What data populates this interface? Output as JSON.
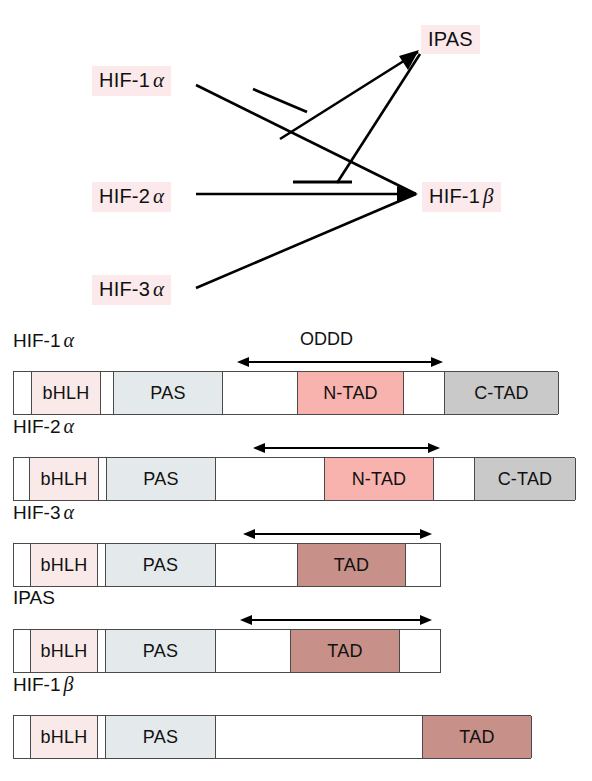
{
  "network": {
    "nodes": [
      {
        "id": "hif1a",
        "base": "HIF-1",
        "greek": "α",
        "name": "HIF-1α"
      },
      {
        "id": "hif2a",
        "base": "HIF-2",
        "greek": "α",
        "name": "HIF-2α"
      },
      {
        "id": "hif3a",
        "base": "HIF-3",
        "greek": "α",
        "name": "HIF-3α"
      },
      {
        "id": "ipas",
        "base": "IPAS",
        "greek": "",
        "name": "IPAS"
      },
      {
        "id": "hif1b",
        "base": "HIF-1",
        "greek": "β",
        "name": "HIF-1β"
      }
    ],
    "edges": [
      {
        "from": "hif2a",
        "to": "hif1b",
        "kind": "arrow"
      },
      {
        "from": "hif3a",
        "to": "hif1b",
        "kind": "arrow"
      },
      {
        "from": "hif1a",
        "to": "hif1b",
        "kind": "arrow"
      },
      {
        "from": "ipas",
        "to": "hif1a",
        "kind": "inhibition"
      },
      {
        "from": "ipas",
        "to": "hif2a",
        "kind": "inhibition"
      }
    ],
    "line_color": "#000000"
  },
  "rows": [
    {
      "id": "hif1a",
      "label_base": "HIF-1",
      "label_greek": "α",
      "annotation": "ODDD",
      "bar": {
        "left": 13,
        "width": 545
      },
      "arrow": {
        "left": 237,
        "right": 443
      },
      "annotation_left": 300,
      "segments": [
        {
          "name": "bHLH",
          "label": "bHLH",
          "left": 30,
          "width": 70,
          "style": "seg-bhlh"
        },
        {
          "name": "PAS",
          "label": "PAS",
          "left": 112,
          "width": 110,
          "style": "seg-pas"
        },
        {
          "name": "N-TAD",
          "label": "N-TAD",
          "left": 296,
          "width": 107,
          "style": "seg-ntad"
        },
        {
          "name": "C-TAD",
          "label": "C-TAD",
          "left": 443,
          "width": 115,
          "style": "seg-ctad"
        }
      ]
    },
    {
      "id": "hif2a",
      "label_base": "HIF-2",
      "label_greek": "α",
      "annotation": "",
      "bar": {
        "left": 13,
        "width": 562
      },
      "arrow": {
        "left": 253,
        "right": 440
      },
      "annotation_left": 0,
      "segments": [
        {
          "name": "bHLH",
          "label": "bHLH",
          "left": 28,
          "width": 70,
          "style": "seg-bhlh"
        },
        {
          "name": "PAS",
          "label": "PAS",
          "left": 105,
          "width": 110,
          "style": "seg-pas"
        },
        {
          "name": "N-TAD",
          "label": "N-TAD",
          "left": 323,
          "width": 110,
          "style": "seg-ntad"
        },
        {
          "name": "C-TAD",
          "label": "C-TAD",
          "left": 473,
          "width": 102,
          "style": "seg-ctad"
        }
      ]
    },
    {
      "id": "hif3a",
      "label_base": "HIF-3",
      "label_greek": "α",
      "annotation": "",
      "bar": {
        "left": 13,
        "width": 428
      },
      "arrow": {
        "left": 243,
        "right": 432
      },
      "annotation_left": 0,
      "segments": [
        {
          "name": "bHLH",
          "label": "bHLH",
          "left": 29,
          "width": 68,
          "style": "seg-bhlh"
        },
        {
          "name": "PAS",
          "label": "PAS",
          "left": 104,
          "width": 111,
          "style": "seg-pas"
        },
        {
          "name": "TAD",
          "label": "TAD",
          "left": 296,
          "width": 109,
          "style": "seg-tad"
        }
      ]
    },
    {
      "id": "ipas",
      "label_base": "IPAS",
      "label_greek": "",
      "annotation": "",
      "bar": {
        "left": 13,
        "width": 428
      },
      "arrow": {
        "left": 240,
        "right": 432
      },
      "annotation_left": 0,
      "segments": [
        {
          "name": "bHLH",
          "label": "bHLH",
          "left": 29,
          "width": 68,
          "style": "seg-bhlh"
        },
        {
          "name": "PAS",
          "label": "PAS",
          "left": 104,
          "width": 111,
          "style": "seg-pas"
        },
        {
          "name": "TAD",
          "label": "TAD",
          "left": 289,
          "width": 110,
          "style": "seg-tad"
        }
      ]
    },
    {
      "id": "hif1b",
      "label_base": "HIF-1",
      "label_greek": "β",
      "annotation": "",
      "bar": {
        "left": 13,
        "width": 518
      },
      "arrow": null,
      "annotation_left": 0,
      "segments": [
        {
          "name": "bHLH",
          "label": "bHLH",
          "left": 29,
          "width": 68,
          "style": "seg-bhlh"
        },
        {
          "name": "PAS",
          "label": "PAS",
          "left": 104,
          "width": 111,
          "style": "seg-pas"
        },
        {
          "name": "TAD",
          "label": "TAD",
          "left": 421,
          "width": 110,
          "style": "seg-tad"
        }
      ]
    }
  ],
  "colors": {
    "bhlh": "#fae9e9",
    "pas": "#e4eaec",
    "ntad": "#f9b3ae",
    "tad": "#c79089",
    "ctad": "#c9c9c9",
    "label_highlight": "#fbe9ec",
    "stroke": "#4a4a4a"
  }
}
